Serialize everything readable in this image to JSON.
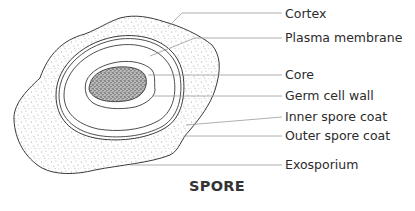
{
  "diagram": {
    "title": "SPORE",
    "labels": [
      {
        "text": "Cortex",
        "y": 14
      },
      {
        "text": "Plasma membrane",
        "y": 38
      },
      {
        "text": "Core",
        "y": 75
      },
      {
        "text": "Germ cell wall",
        "y": 96
      },
      {
        "text": "Inner spore coat",
        "y": 117
      },
      {
        "text": "Outer spore coat",
        "y": 136
      },
      {
        "text": "Exosporium",
        "y": 165
      }
    ],
    "colors": {
      "outline": "#3a3a3a",
      "leader_line": "#9a9a9a",
      "stipple": "#555555",
      "text": "#2b2b2b"
    }
  }
}
